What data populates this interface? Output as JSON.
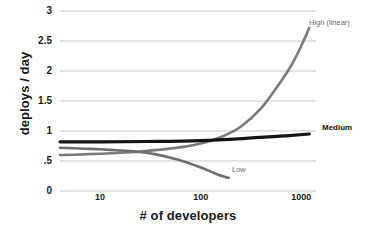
{
  "chart_data": {
    "type": "line",
    "title": "",
    "xlabel": "# of developers",
    "ylabel": "deploys / day",
    "xscale": "log",
    "yscale": "linear",
    "xlim": [
      4,
      1400
    ],
    "ylim": [
      0,
      3
    ],
    "grid": true,
    "legend_position": "inline-end-of-line",
    "xticks": [
      "10",
      "100",
      "1000"
    ],
    "xtick_values": [
      10,
      100,
      1000
    ],
    "yticks": [
      "3",
      "2.5",
      "2",
      "1.5",
      "1",
      ".5",
      "0"
    ],
    "ytick_values": [
      3,
      2.5,
      2,
      1.5,
      1,
      0.5,
      0
    ],
    "series": [
      {
        "name": "High (linear)",
        "label": "High (linear)",
        "color": "#7a7a7a",
        "width": 2.6,
        "x": [
          4,
          7,
          10,
          20,
          40,
          70,
          100,
          160,
          250,
          400,
          600,
          800,
          1000,
          1200
        ],
        "y": [
          0.6,
          0.61,
          0.62,
          0.645,
          0.69,
          0.74,
          0.79,
          0.9,
          1.07,
          1.38,
          1.78,
          2.1,
          2.42,
          2.72
        ]
      },
      {
        "name": "Medium",
        "label": "Medium",
        "color": "#141414",
        "width": 3.2,
        "x": [
          4,
          10,
          30,
          100,
          300,
          700,
          1200
        ],
        "y": [
          0.82,
          0.82,
          0.825,
          0.84,
          0.88,
          0.92,
          0.95
        ]
      },
      {
        "name": "Low",
        "label": "Low",
        "color": "#6e6e6e",
        "width": 2.6,
        "x": [
          4,
          7,
          10,
          16,
          22,
          35,
          60,
          90,
          120,
          150,
          175,
          190
        ],
        "y": [
          0.72,
          0.705,
          0.695,
          0.675,
          0.66,
          0.615,
          0.52,
          0.42,
          0.34,
          0.27,
          0.235,
          0.22
        ]
      }
    ],
    "colors": {
      "grid": "#c8c8c8",
      "axis": "#b4b4b4",
      "text": "#1a1a1a",
      "muted_text": "#6e6e6e",
      "background": "#ffffff"
    }
  }
}
